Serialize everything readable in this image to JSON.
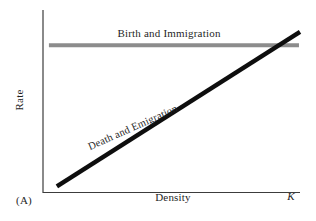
{
  "figure": {
    "panel_label": "(A)",
    "background": "#ffffff"
  },
  "chart_data": {
    "type": "line",
    "title": "",
    "xlabel": "Density",
    "ylabel": "Rate",
    "x_range": [
      0,
      1
    ],
    "y_range": [
      0,
      1
    ],
    "grid": false,
    "legend": "inline-labels",
    "axis_color": "#3c3c3c",
    "text_color": "#1f1f1f",
    "x_tick_labels": [
      {
        "label": "K",
        "x": 0.965,
        "style": "italic"
      }
    ],
    "series": [
      {
        "name": "Birth and Immigration",
        "color": "#8c8c8c",
        "stroke_px": 4,
        "points": [
          [
            0.023,
            0.807
          ],
          [
            0.996,
            0.807
          ]
        ]
      },
      {
        "name": "Death and Emigration",
        "color": "#0e0e0e",
        "stroke_px": 4.5,
        "points": [
          [
            0.054,
            0.036
          ],
          [
            1.0,
            0.88
          ]
        ]
      }
    ]
  }
}
